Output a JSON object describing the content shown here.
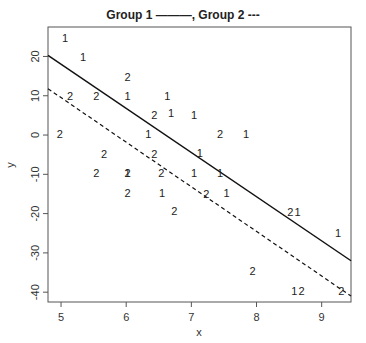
{
  "legend": {
    "group1_label": "Group 1",
    "group1_style": "———",
    "separator": ",",
    "group2_label": "Group 2",
    "group2_style": "---"
  },
  "axes": {
    "xlabel": "x",
    "ylabel": "y",
    "xticks": [
      "5",
      "6",
      "7",
      "8",
      "9"
    ],
    "yticks": [
      "20",
      "10",
      "0",
      "-10",
      "-20",
      "-30",
      "-40"
    ]
  },
  "chart_data": {
    "type": "scatter",
    "xlabel": "x",
    "ylabel": "y",
    "xlim": [
      4.8,
      9.45
    ],
    "ylim": [
      -42.5,
      27.5
    ],
    "xticks": [
      5,
      6,
      7,
      8,
      9
    ],
    "yticks": [
      -40,
      -30,
      -20,
      -10,
      0,
      10,
      20
    ],
    "grid": false,
    "legend_position": "top",
    "series": [
      {
        "name": "Group 1",
        "marker": "1",
        "points": [
          [
            5.06,
            24.4
          ],
          [
            5.34,
            19.6
          ],
          [
            6.02,
            9.7
          ],
          [
            6.63,
            9.7
          ],
          [
            6.69,
            5.4
          ],
          [
            7.04,
            4.9
          ],
          [
            6.34,
            0.0
          ],
          [
            7.84,
            0.0
          ],
          [
            7.13,
            -4.8
          ],
          [
            6.02,
            -9.9
          ],
          [
            7.04,
            -10.0
          ],
          [
            7.44,
            -10.0
          ],
          [
            6.55,
            -15.0
          ],
          [
            7.54,
            -15.0
          ],
          [
            8.63,
            -19.8
          ],
          [
            9.25,
            -25.1
          ],
          [
            8.58,
            -40.1
          ]
        ],
        "fit_line": {
          "style": "solid",
          "x": [
            4.8,
            9.45
          ],
          "y": [
            20.3,
            -32.0
          ]
        }
      },
      {
        "name": "Group 2",
        "marker": "2",
        "points": [
          [
            6.02,
            14.5
          ],
          [
            5.14,
            9.7
          ],
          [
            5.54,
            9.7
          ],
          [
            6.43,
            4.9
          ],
          [
            4.98,
            0.0
          ],
          [
            7.44,
            0.0
          ],
          [
            6.43,
            -5.1
          ],
          [
            5.66,
            -5.1
          ],
          [
            5.54,
            -9.9
          ],
          [
            6.02,
            -9.9
          ],
          [
            6.54,
            -9.9
          ],
          [
            6.02,
            -15.0
          ],
          [
            7.23,
            -15.2
          ],
          [
            6.74,
            -19.6
          ],
          [
            8.52,
            -19.8
          ],
          [
            7.94,
            -34.9
          ],
          [
            8.69,
            -40.1
          ],
          [
            9.3,
            -40.1
          ]
        ],
        "fit_line": {
          "style": "dashed",
          "x": [
            4.8,
            9.45
          ],
          "y": [
            11.8,
            -41.0
          ]
        }
      }
    ]
  }
}
